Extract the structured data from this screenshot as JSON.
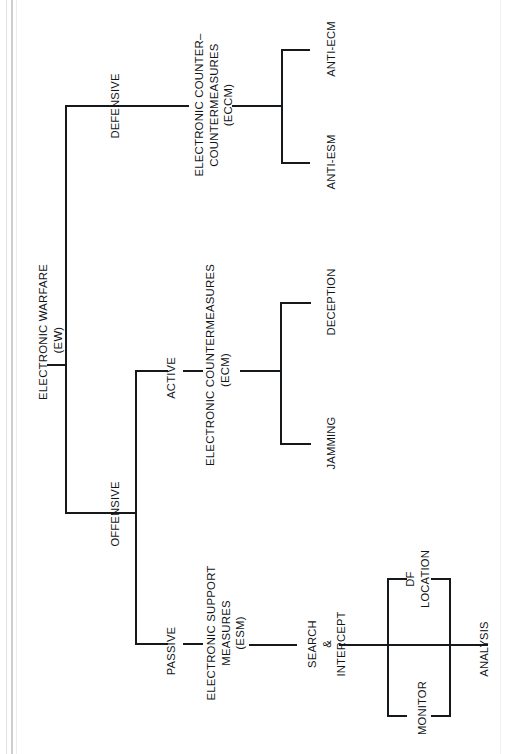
{
  "diagram": {
    "orientation": "rotated-90-ccw",
    "line_color": "#15191c",
    "text_color": "#111417",
    "background": "#ffffff",
    "nodes": {
      "root": "ELECTRONIC WARFARE\n(EW)",
      "defensive": "DEFENSIVE",
      "offensive": "OFFENSIVE",
      "active": "ACTIVE",
      "passive": "PASSIVE",
      "eccm": "ELECTRONIC COUNTER–\nCOUNTERMEASURES\n(ECCM)",
      "ecm": "ELECTRONIC COUNTERMEASURES\n(ECM)",
      "esm": "ELECTRONIC SUPPORT\nMEASURES\n(ESM)",
      "anti_ecm": "ANTI-ECM",
      "anti_esm": "ANTI-ESM",
      "deception": "DECEPTION",
      "jamming": "JAMMING",
      "search_intercept": "SEARCH\n&\nINTERCEPT",
      "df_location": "DF\nLOCATION",
      "monitor": "MONITOR",
      "analysis": "ANALYSIS"
    },
    "edges": [
      {
        "from": "root",
        "to": "defensive"
      },
      {
        "from": "root",
        "to": "offensive"
      },
      {
        "from": "defensive",
        "to": "eccm"
      },
      {
        "from": "eccm",
        "to": "anti_ecm"
      },
      {
        "from": "eccm",
        "to": "anti_esm"
      },
      {
        "from": "offensive",
        "to": "active"
      },
      {
        "from": "offensive",
        "to": "passive"
      },
      {
        "from": "active",
        "to": "ecm"
      },
      {
        "from": "ecm",
        "to": "jamming"
      },
      {
        "from": "ecm",
        "to": "deception"
      },
      {
        "from": "passive",
        "to": "esm"
      },
      {
        "from": "esm",
        "to": "search_intercept"
      },
      {
        "from": "search_intercept",
        "to": "df_location"
      },
      {
        "from": "search_intercept",
        "to": "monitor"
      },
      {
        "from": "search_intercept",
        "to": "analysis"
      }
    ]
  }
}
